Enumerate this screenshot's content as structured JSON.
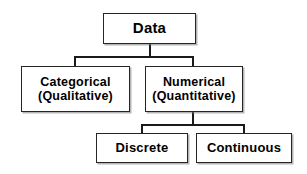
{
  "diagram": {
    "type": "tree-hierarchy",
    "orientation": "top-down",
    "background_color": "#ffffff",
    "line_color": "#1a1a1a",
    "box_border_color": "#262626",
    "text_color": "#000000",
    "nodes": {
      "root": {
        "label": "Data"
      },
      "categorical": {
        "line1": "Categorical",
        "line2": "(Qualitative)"
      },
      "numerical": {
        "line1": "Numerical",
        "line2": "(Quantitative)"
      },
      "discrete": {
        "label": "Discrete"
      },
      "continuous": {
        "label": "Continuous"
      }
    },
    "edges": [
      {
        "from": "Data",
        "to": "Categorical (Qualitative)"
      },
      {
        "from": "Data",
        "to": "Numerical (Quantitative)"
      },
      {
        "from": "Numerical (Quantitative)",
        "to": "Discrete"
      },
      {
        "from": "Numerical (Quantitative)",
        "to": "Continuous"
      }
    ]
  }
}
